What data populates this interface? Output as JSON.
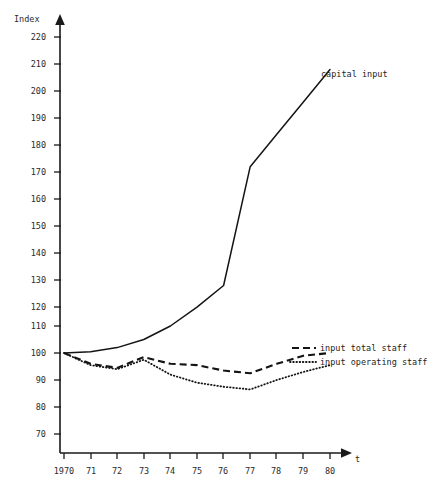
{
  "caption": {
    "text": ""
  },
  "axes": {
    "y_axis_title": "Index",
    "x_axis_title": "t",
    "y_ticks": [
      "220",
      "210",
      "200",
      "190",
      "180",
      "170",
      "160",
      "150",
      "140",
      "130",
      "120",
      "110",
      "100",
      "90",
      "80",
      "70"
    ],
    "x_ticks": [
      "1970",
      "71",
      "72",
      "73",
      "74",
      "75",
      "76",
      "77",
      "78",
      "79",
      "80"
    ]
  },
  "annotations": {
    "capital_input": "capital input",
    "input_total_staff": "input total staff",
    "input_operating_staff": "input operating staff"
  },
  "colors": {
    "ink": "#141414",
    "axis": "#1a1a1a",
    "background": "#ffffff"
  },
  "chart_data": {
    "type": "line",
    "title": "",
    "xlabel": "t",
    "ylabel": "Index",
    "grid": false,
    "legend_position": "inline-right",
    "xlim": [
      1970,
      1980
    ],
    "ylim": [
      70,
      225
    ],
    "ytick_step": 10,
    "x": [
      1970,
      1971,
      1972,
      1973,
      1974,
      1975,
      1976,
      1977,
      1978,
      1979,
      1980
    ],
    "x_tick_labels": [
      "1970",
      "71",
      "72",
      "73",
      "74",
      "75",
      "76",
      "77",
      "78",
      "79",
      "80"
    ],
    "series": [
      {
        "name": "capital input",
        "style": "solid",
        "values": [
          100,
          100.5,
          102,
          105,
          110,
          117,
          125,
          169,
          181,
          193,
          205
        ]
      },
      {
        "name": "input total staff",
        "style": "dashed",
        "values": [
          100,
          96,
          94.5,
          98.5,
          96,
          95.5,
          93.5,
          92.5,
          96,
          99,
          100
        ]
      },
      {
        "name": "input operating staff",
        "style": "dotted",
        "values": [
          100,
          95.5,
          94,
          97.5,
          92,
          89,
          87.5,
          86.5,
          90,
          93,
          95.5
        ]
      }
    ]
  }
}
